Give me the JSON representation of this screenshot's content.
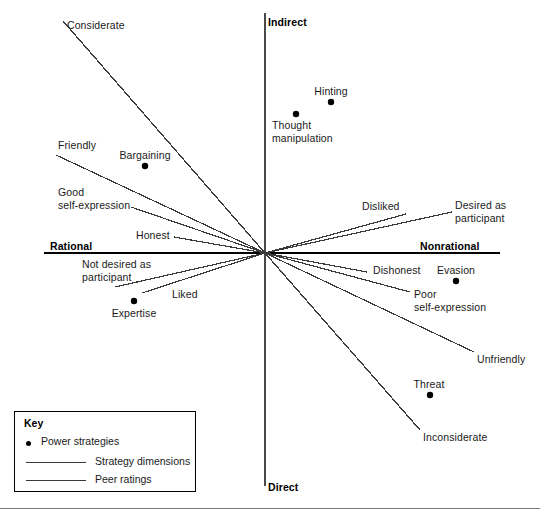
{
  "figure": {
    "background": "#ffffff",
    "line_color": "#3a3a3a",
    "axis_color": "#4a4a4a",
    "point_color": "#000000"
  },
  "axes": {
    "origin": {
      "x": 265,
      "y": 253
    },
    "vertical": {
      "x": 265,
      "y1": 13,
      "y2": 486
    },
    "horizontal": {
      "y": 253,
      "x1": 44,
      "x2": 500
    },
    "labels": {
      "top": "Indirect",
      "bottom": "Direct",
      "left": "Rational",
      "right": "Nonrational"
    },
    "label_positions": {
      "top": {
        "x": 268,
        "y": 16
      },
      "bottom": {
        "x": 268,
        "y": 481
      },
      "left": {
        "x": 50,
        "y": 240
      },
      "right": {
        "x": 420,
        "y": 240
      }
    },
    "underlines": {
      "left": {
        "x1": 44,
        "x2": 265,
        "y": 253
      },
      "right": {
        "x1": 265,
        "x2": 500,
        "y": 253
      }
    }
  },
  "chart_data": {
    "type": "scatter",
    "title": "",
    "xlabel": "Rational — Nonrational",
    "ylabel": "Indirect — Direct",
    "grid": false,
    "legend_position": "bottom-left",
    "points": [
      {
        "label": "Bargaining",
        "x": 145,
        "y": 166,
        "label_x": 145,
        "label_y": 149,
        "label_align": "center"
      },
      {
        "label": "Hinting",
        "x": 331,
        "y": 102,
        "label_x": 331,
        "label_y": 85,
        "label_align": "center"
      },
      {
        "label": "Thought\nmanipulation",
        "x": 296,
        "y": 114,
        "label_x": 272,
        "label_y": 119,
        "label_align": "left"
      },
      {
        "label": "Expertise",
        "x": 134,
        "y": 301,
        "label_x": 134,
        "label_y": 307,
        "label_align": "center"
      },
      {
        "label": "Evasion",
        "x": 456,
        "y": 281,
        "label_x": 456,
        "label_y": 264,
        "label_align": "center"
      },
      {
        "label": "Threat",
        "x": 430,
        "y": 395,
        "label_x": 429,
        "label_y": 378,
        "label_align": "center"
      }
    ],
    "strategy_dimension_lines": [
      {
        "label": "Considerate",
        "x1": 63,
        "y1": 21,
        "x2": 265,
        "y2": 253,
        "label_x": 67,
        "label_y": 19,
        "label_align": "left"
      },
      {
        "label": "Inconsiderate",
        "x1": 265,
        "y1": 253,
        "x2": 420,
        "y2": 430,
        "label_x": 423,
        "label_y": 431,
        "label_align": "left"
      }
    ],
    "peer_rating_lines": [
      {
        "label": "Friendly",
        "x1": 56,
        "y1": 155,
        "x2": 265,
        "y2": 253,
        "label_x": 58,
        "label_y": 139,
        "label_align": "left"
      },
      {
        "label": "Good\nself-expression",
        "x1": 131,
        "y1": 207,
        "x2": 265,
        "y2": 253,
        "label_x": 58,
        "label_y": 186,
        "label_align": "left"
      },
      {
        "label": "Honest",
        "x1": 174,
        "y1": 237,
        "x2": 265,
        "y2": 253,
        "label_x": 136,
        "label_y": 229,
        "label_align": "left"
      },
      {
        "label": "Disliked",
        "x1": 265,
        "y1": 253,
        "x2": 406,
        "y2": 214,
        "label_x": 362,
        "label_y": 200,
        "label_align": "left"
      },
      {
        "label": "Desired as\nparticipant",
        "x1": 265,
        "y1": 253,
        "x2": 452,
        "y2": 212,
        "label_x": 455,
        "label_y": 199,
        "label_align": "left"
      },
      {
        "label": "Not desired as\nparticipant",
        "x1": 115,
        "y1": 287,
        "x2": 265,
        "y2": 253,
        "label_x": 82,
        "label_y": 258,
        "label_align": "left"
      },
      {
        "label": "Liked",
        "x1": 142,
        "y1": 293,
        "x2": 265,
        "y2": 253,
        "label_x": 172,
        "label_y": 288,
        "label_align": "left"
      },
      {
        "label": "Dishonest",
        "x1": 265,
        "y1": 253,
        "x2": 367,
        "y2": 272,
        "label_x": 373,
        "label_y": 264,
        "label_align": "left"
      },
      {
        "label": "Poor\nself-expression",
        "x1": 265,
        "y1": 253,
        "x2": 410,
        "y2": 292,
        "label_x": 414,
        "label_y": 288,
        "label_align": "left"
      },
      {
        "label": "Unfriendly",
        "x1": 265,
        "y1": 253,
        "x2": 474,
        "y2": 352,
        "label_x": 477,
        "label_y": 353,
        "label_align": "left"
      }
    ]
  },
  "key": {
    "title": "Key",
    "items": [
      {
        "symbol": "dot",
        "label": "Power strategies"
      },
      {
        "symbol": "line",
        "label": "Strategy dimensions"
      },
      {
        "symbol": "line",
        "label": "Peer ratings"
      }
    ]
  }
}
